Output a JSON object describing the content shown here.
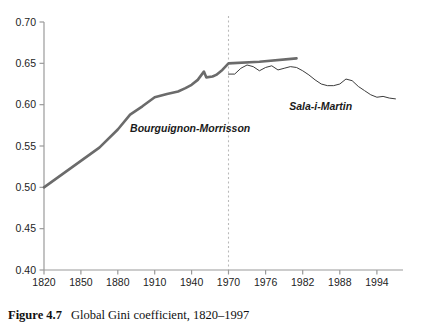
{
  "caption": {
    "number": "Figure 4.7",
    "text": "Global Gini coefficient, 1820–1997"
  },
  "chart_data": {
    "type": "line",
    "title": "",
    "xlabel": "",
    "ylabel": "",
    "xlim": [
      1820,
      1997
    ],
    "ylim": [
      0.4,
      0.7
    ],
    "grid": false,
    "legend_position": "inline-annotations",
    "y_ticks": [
      "0.40",
      "0.45",
      "0.50",
      "0.55",
      "0.60",
      "0.65",
      "0.70"
    ],
    "y_tick_values": [
      0.4,
      0.45,
      0.5,
      0.55,
      0.6,
      0.65,
      0.7
    ],
    "x_ticks": [
      "1820",
      "1850",
      "1880",
      "1910",
      "1940",
      "1970",
      "1976",
      "1982",
      "1988",
      "1994"
    ],
    "x_tick_values": [
      1820,
      1850,
      1880,
      1910,
      1940,
      1970,
      1976,
      1982,
      1988,
      1994
    ],
    "annotations": [
      {
        "text": "Bourguignon-Morrisson",
        "x": 1890,
        "y": 0.567
      },
      {
        "text": "Sala-i-Martin",
        "x": 1990,
        "y": 0.594
      }
    ],
    "reference_line": {
      "x": 1970,
      "style": "dashed",
      "color": "#b9b9b9"
    },
    "colors": {
      "bourguignon_morrisson": "#6b6b6b",
      "sala_i_martin": "#3c3c3c",
      "axis": "#9a9a9a"
    },
    "series": [
      {
        "name": "Bourguignon-Morrisson",
        "color": "#6b6b6b",
        "width": 2.6,
        "x": [
          1820,
          1850,
          1865,
          1880,
          1890,
          1900,
          1910,
          1920,
          1929,
          1935,
          1940,
          1945,
          1950,
          1952,
          1957,
          1960,
          1965,
          1970,
          1975,
          1981
        ],
        "values": [
          0.5,
          0.532,
          0.548,
          0.57,
          0.588,
          0.598,
          0.609,
          0.613,
          0.616,
          0.62,
          0.624,
          0.63,
          0.64,
          0.633,
          0.634,
          0.636,
          0.642,
          0.65,
          0.652,
          0.656
        ]
      },
      {
        "name": "Sala-i-Martin",
        "color": "#3c3c3c",
        "width": 1.0,
        "x": [
          1970,
          1971,
          1972,
          1973,
          1974,
          1975,
          1976,
          1977,
          1978,
          1979,
          1980,
          1981,
          1982,
          1983,
          1984,
          1985,
          1986,
          1987,
          1988,
          1989,
          1990,
          1991,
          1992,
          1993,
          1994,
          1995,
          1996,
          1997
        ],
        "values": [
          0.637,
          0.637,
          0.644,
          0.648,
          0.646,
          0.641,
          0.645,
          0.647,
          0.642,
          0.644,
          0.646,
          0.645,
          0.641,
          0.636,
          0.63,
          0.625,
          0.623,
          0.623,
          0.625,
          0.631,
          0.629,
          0.622,
          0.617,
          0.612,
          0.609,
          0.61,
          0.608,
          0.607
        ]
      }
    ]
  }
}
